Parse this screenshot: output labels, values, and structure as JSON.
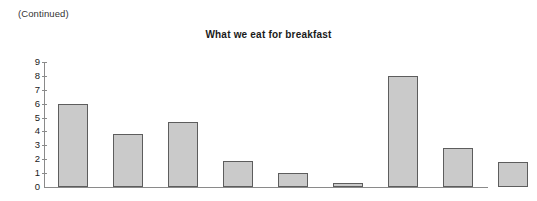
{
  "page": {
    "continued_note": "(Continued)"
  },
  "chart_data": {
    "type": "bar",
    "title": "What we eat for breakfast",
    "xlabel": "",
    "ylabel": "",
    "ylim": [
      0,
      9
    ],
    "grid": false,
    "legend": false,
    "y_ticks": [
      0,
      1,
      2,
      3,
      4,
      5,
      6,
      7,
      8,
      9
    ],
    "y_tick_labels": [
      "0",
      "1",
      "2",
      "3",
      "4",
      "5",
      "6",
      "7",
      "8",
      "9"
    ],
    "categories": [
      "",
      "",
      "",
      "",
      "",
      "",
      "",
      "",
      ""
    ],
    "values": [
      6,
      3.8,
      4.7,
      1.9,
      1,
      0.3,
      8,
      2.8,
      1.8
    ],
    "bar_color": "#cacaca",
    "bar_edge_color": "#5d5d5d",
    "axis_color": "#8a8a8a",
    "bar_geometry": [
      {
        "left": 14,
        "width": 30
      },
      {
        "left": 69,
        "width": 30
      },
      {
        "left": 124,
        "width": 30
      },
      {
        "left": 179,
        "width": 30
      },
      {
        "left": 234,
        "width": 30
      },
      {
        "left": 289,
        "width": 30
      },
      {
        "left": 344,
        "width": 30
      },
      {
        "left": 399,
        "width": 30
      },
      {
        "left": 454,
        "width": 30
      }
    ]
  }
}
